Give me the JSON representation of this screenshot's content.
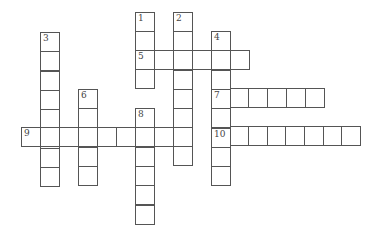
{
  "puzzle": {
    "type": "crossword",
    "cell_size": 19,
    "line_color": "#555555",
    "cell_color": "#ffffff",
    "words": [
      {
        "number": "1",
        "direction": "down",
        "left": 135,
        "top": 12,
        "length": 4,
        "cell": 19
      },
      {
        "number": "2",
        "direction": "down",
        "left": 173,
        "top": 12,
        "length": 8,
        "cell": 19.2
      },
      {
        "number": "3",
        "direction": "down",
        "left": 40,
        "top": 32,
        "length": 8,
        "cell": 19.3
      },
      {
        "number": "4",
        "direction": "down",
        "left": 211,
        "top": 31,
        "length": 8,
        "cell": 19.3
      },
      {
        "number": "5",
        "direction": "across",
        "left": 135,
        "top": 50,
        "length": 6,
        "cell": 19
      },
      {
        "number": "6",
        "direction": "down",
        "left": 78,
        "top": 89,
        "length": 5,
        "cell": 19.2
      },
      {
        "number": "7",
        "direction": "across",
        "left": 211,
        "top": 88,
        "length": 6,
        "cell": 18.7
      },
      {
        "number": "8",
        "direction": "down",
        "left": 135,
        "top": 108,
        "length": 6,
        "cell": 19.3
      },
      {
        "number": "9",
        "direction": "across",
        "left": 21,
        "top": 127,
        "length": 9,
        "cell": 19
      },
      {
        "number": "10",
        "direction": "across",
        "left": 211,
        "top": 126,
        "length": 8,
        "cell": 18.6
      }
    ]
  }
}
